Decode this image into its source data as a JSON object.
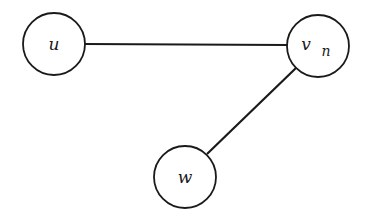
{
  "diagram": {
    "type": "graph",
    "nodes": [
      {
        "id": "u",
        "label": "u",
        "subscript": "",
        "cx": 54,
        "cy": 44,
        "r": 31
      },
      {
        "id": "vn",
        "label": "v",
        "subscript": "n",
        "cx": 318,
        "cy": 46,
        "r": 31
      },
      {
        "id": "w",
        "label": "w",
        "subscript": "",
        "cx": 185,
        "cy": 177,
        "r": 31
      }
    ],
    "edges": [
      {
        "from": "u",
        "to": "vn"
      },
      {
        "from": "vn",
        "to": "w"
      }
    ],
    "colors": {
      "stroke": "#1a1a1a",
      "background": "#ffffff"
    }
  }
}
